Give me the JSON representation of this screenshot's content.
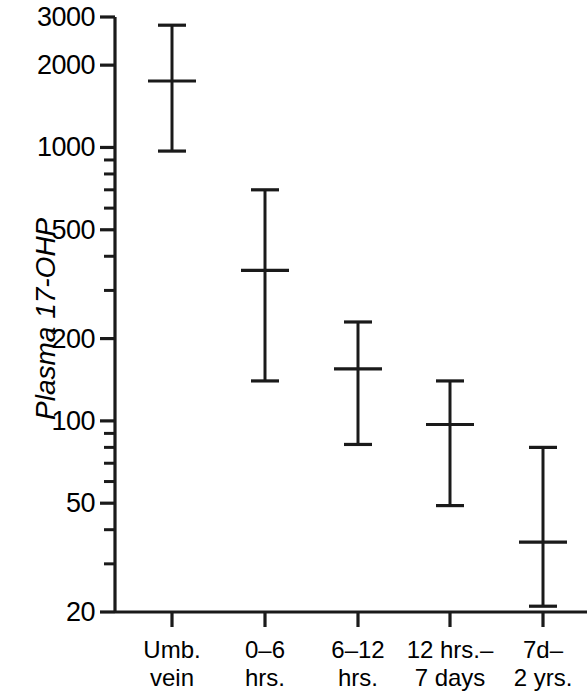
{
  "chart_data": {
    "type": "scatter",
    "title": "",
    "subtitle": "",
    "xlabel": "",
    "ylabel": "Plasma 17-OHP",
    "scale": "log",
    "grid": false,
    "legend": false,
    "ylim": [
      20,
      3000
    ],
    "ytick_labels": [
      "3000",
      "2000",
      "1000",
      "500",
      "200",
      "100",
      "50",
      "20"
    ],
    "ytick_values": [
      3000,
      2000,
      1000,
      500,
      200,
      100,
      50,
      20
    ],
    "yminor_values": [
      900,
      800,
      700,
      600,
      400,
      300,
      90,
      80,
      70,
      60,
      40,
      30
    ],
    "categories": [
      "Umb. vein",
      "0–6 hrs.",
      "6–12 hrs.",
      "12 hrs.– 7 days",
      "7d– 2 yrs."
    ],
    "category_lines": [
      [
        "Umb.",
        "vein"
      ],
      [
        "0–6",
        "hrs."
      ],
      [
        "6–12",
        "hrs."
      ],
      [
        "12 hrs.–",
        "7 days"
      ],
      [
        "7d–",
        "2 yrs."
      ]
    ],
    "series": [
      {
        "name": "Plasma 17-OHP",
        "marker": "mean-with-range",
        "values": [
          1750,
          355,
          155,
          97,
          36
        ],
        "upper": [
          2800,
          700,
          230,
          140,
          80
        ],
        "lower": [
          970,
          140,
          82,
          49,
          21
        ]
      }
    ],
    "annotations": []
  },
  "figure": {
    "axis_color": "#1a1a1a",
    "marker_color": "#1a1a1a",
    "background": "#ffffff"
  }
}
